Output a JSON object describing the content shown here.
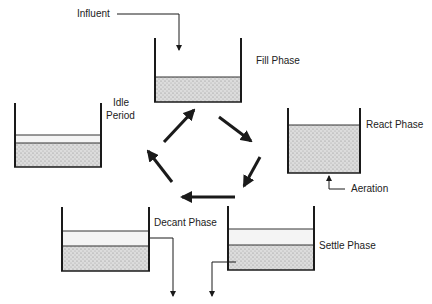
{
  "diagram": {
    "labels": {
      "influent": "Influent",
      "fill": "Fill Phase",
      "react": "React Phase",
      "aeration": "Aeration",
      "settle": "Settle Phase",
      "decant": "Decant Phase",
      "idle_line1": "Idle",
      "idle_line2": "Period"
    },
    "tanks": [
      {
        "id": "fill",
        "x": 155,
        "top": 38,
        "w": 86,
        "bottom": 102,
        "clear_top": null,
        "sludge_top": 77
      },
      {
        "id": "react",
        "x": 288,
        "top": 108,
        "w": 72,
        "bottom": 173,
        "clear_top": null,
        "sludge_top": 125
      },
      {
        "id": "settle",
        "x": 228,
        "top": 206,
        "w": 86,
        "bottom": 270,
        "clear_top": 229,
        "sludge_top": 245
      },
      {
        "id": "decant",
        "x": 62,
        "top": 207,
        "w": 87,
        "bottom": 271,
        "clear_top": 231,
        "sludge_top": 246
      },
      {
        "id": "idle",
        "x": 15,
        "top": 103,
        "w": 86,
        "bottom": 167,
        "clear_top": 135,
        "sludge_top": 143
      }
    ],
    "cycle_arrows": [
      {
        "from": "idle",
        "to": "fill"
      },
      {
        "from": "fill",
        "to": "react"
      },
      {
        "from": "react",
        "to": "settle"
      },
      {
        "from": "settle",
        "to": "decant"
      },
      {
        "from": "decant",
        "to": "idle"
      }
    ],
    "colors": {
      "line": "#1a1a1a",
      "sludge": "#d6d6d6",
      "clear": "#f4f4f4"
    }
  }
}
